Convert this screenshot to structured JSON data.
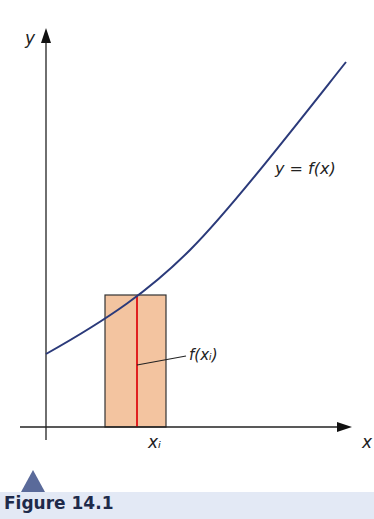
{
  "figure": {
    "caption": "Figure 14.1",
    "labels": {
      "y_axis": "y",
      "x_axis": "x",
      "curve": "y = f(x)",
      "height": "f(xᵢ)",
      "xi": "xᵢ"
    },
    "colors": {
      "curve": "#2b3a7a",
      "rectangle_fill": "#f3c4a0",
      "rectangle_stroke": "#333333",
      "height_line": "#e02020",
      "axis": "#222222",
      "caption_band": "#e3e9f5",
      "marker": "#5a6a9a"
    }
  }
}
